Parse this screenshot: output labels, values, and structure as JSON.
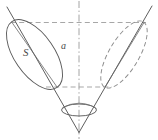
{
  "figure": {
    "kind": "geometry-diagram",
    "width": 158,
    "height": 140,
    "background_color": "#ffffff",
    "stroke_color": "#4a4a4a",
    "dashed_stroke_color": "#8d8d8d",
    "axis_stroke_color": "#9a9a9a",
    "labels": [
      {
        "id": "s",
        "text": "S"
      },
      {
        "id": "a",
        "text": "a"
      }
    ],
    "elements": {
      "vertical_axis": "dash-dot vertical centre axis",
      "upper_horizontal": "dashed horizontal construction line (upper)",
      "lower_horizontal": "dashed horizontal construction line (lower)",
      "left_generator": "solid slanted cone generator, upper-left to apex",
      "right_generator": "solid slanted cone generator, upper-right to apex",
      "left_ellipse": "solid inclined ellipse (front cross-section)",
      "left_ellipse_axis": "solid major-axis chord of the left ellipse",
      "right_ellipse": "dashed inclined ellipse (rear cross-section)",
      "right_ellipse_axis": "solid major-axis chord of the right ellipse",
      "apex_ellipse": "small horizontal ellipse near the apex"
    }
  }
}
